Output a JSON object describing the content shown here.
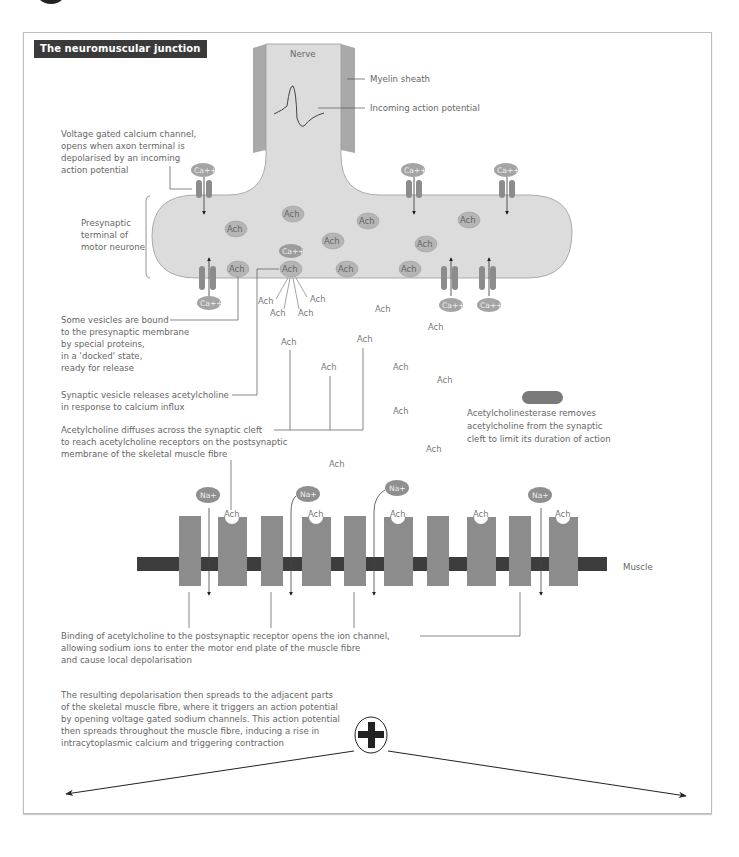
{
  "title": "The neuromuscular junction",
  "colors": {
    "terminal_fill": "#dcdcdc",
    "myelin": "#a9a9a9",
    "channel": "#8c8c8c",
    "vesicle": "#b5b5b5",
    "ion": "#8f8f8f",
    "receptor": "#888888",
    "muscle_bar": "#3d3d3d",
    "text": "#666666",
    "enzyme": "#7a7a7a"
  },
  "labels": {
    "nerve": "Nerve",
    "myelin": "Myelin sheath",
    "action_potential": "Incoming action potential",
    "muscle": "Muscle",
    "presynaptic": [
      "Presynaptic",
      "terminal of",
      "motor neurone"
    ],
    "calcium_channel": [
      "Voltage gated calcium channel,",
      "opens when axon terminal is",
      "depolarised by an incoming",
      "action potential"
    ],
    "docked": [
      "Some vesicles are bound",
      "to the presynaptic membrane",
      "by special proteins,",
      "in a 'docked' state,",
      "ready for release"
    ],
    "release": [
      "Synaptic vesicle releases acetylcholine",
      "in response to calcium influx"
    ],
    "diffuses": [
      "Acetylcholine diffuses across the synaptic cleft",
      "to reach acetylcholine receptors on the postsynaptic",
      "membrane of the skeletal muscle fibre"
    ],
    "esterase": [
      "Acetylcholinesterase removes",
      "acetylcholine from the synaptic",
      "cleft to limit its duration of action"
    ],
    "binding": [
      "Binding of acetylcholine to the postsynaptic receptor opens the ion channel,",
      "allowing sodium ions to enter the motor end plate of the muscle fibre",
      "and cause local depolarisation"
    ],
    "spread": [
      "The resulting depolarisation then spreads to the adjacent parts",
      "of the skeletal muscle fibre, where it triggers an action potential",
      "by opening voltage gated sodium channels. This action potential",
      "then spreads throughout the muscle fibre, inducing a rise in",
      "intracytoplasmic calcium and triggering contraction"
    ]
  },
  "molecules": {
    "ach": "Ach",
    "calcium": "Ca++",
    "sodium": "Na+",
    "plus_symbol": "+"
  }
}
